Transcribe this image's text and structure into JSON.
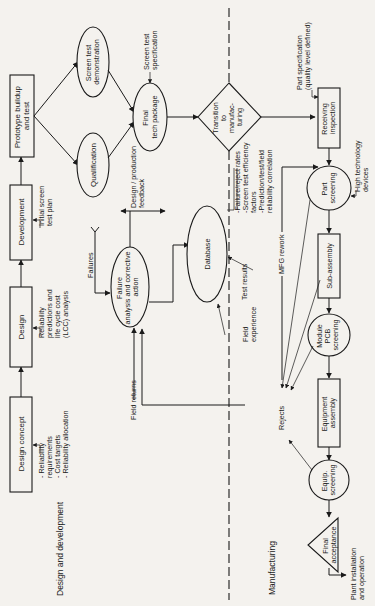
{
  "sections": {
    "design": "Design and development",
    "manufacturing": "Manufacturing"
  },
  "nodes": {
    "design_concept": "Design concept",
    "design": "Design",
    "development": "Development",
    "prototype": [
      "Prototype buildup",
      "and test"
    ],
    "qualification": "Qualification",
    "screen_test_demo": [
      "Screen test",
      "demonstration"
    ],
    "final_tech_package": [
      "Final",
      "tech package"
    ],
    "transition": [
      "Transition",
      "to",
      "manufac-",
      "turing"
    ],
    "receiving_inspection": [
      "Receiving",
      "inspection"
    ],
    "part_screening": [
      "Part",
      "screening"
    ],
    "sub_assembly": "Sub-assembly",
    "module_pcb": [
      "Module",
      "PCB",
      "screening"
    ],
    "equipment_assembly": [
      "Equipment",
      "assembly"
    ],
    "equip_screening": [
      "Equip.",
      "screening"
    ],
    "final_acceptance": [
      "Final",
      "acceptance"
    ],
    "failure_analysis": [
      "Failure",
      "analysis and corrective",
      "action"
    ],
    "database": "Database"
  },
  "annotations": {
    "concept_inputs": [
      "- Reliability",
      "  requirements",
      "- Cost targets",
      "- Reliability allocation"
    ],
    "design_inputs": [
      "Reliability",
      "predictions and",
      "life cycle cost",
      "(LCC) analysis"
    ],
    "dev_inputs": [
      "Initial screen",
      "test plan"
    ],
    "screen_test_spec": [
      "Screen test",
      "specification"
    ],
    "part_spec": [
      "Part specification",
      "(quality level defined)"
    ],
    "high_tech": [
      "High technology",
      "devices"
    ],
    "db_outputs": [
      "-Failure/reject rates",
      "-Screen test efficiency",
      " factors",
      "-Prediction/test/field",
      " reliability correlation"
    ],
    "feedback": [
      "Design / production",
      "feedback"
    ],
    "failures": "Failures",
    "field_returns": "Field returns",
    "field_experience": [
      "Field",
      "experience"
    ],
    "test_results": "Test results",
    "mfg_rework": "MFG rework",
    "rejects": "Rejects",
    "plant_install": [
      "Plant installation",
      "and operation"
    ]
  }
}
